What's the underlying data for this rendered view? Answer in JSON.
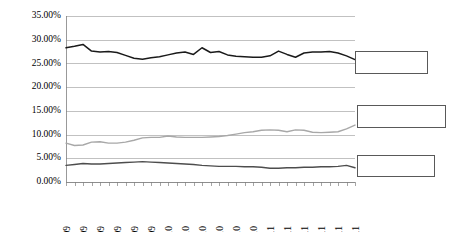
{
  "chart_data": {
    "type": "line",
    "title": "",
    "xlabel": "",
    "ylabel": "",
    "ylim": [
      0,
      35
    ],
    "ytick_values": [
      0,
      5,
      10,
      15,
      20,
      25,
      30,
      35
    ],
    "ytick_labels": [
      "0.00%",
      "5.00%",
      "10.00%",
      "15.00%",
      "20.00%",
      "25.00%",
      "30.00%",
      "35.00%"
    ],
    "grid": "horizontal",
    "legend": "none",
    "x": [
      "Jan-09",
      "Feb-09",
      "Mar-09",
      "Apr-09",
      "May-09",
      "Jun-09",
      "Jul-09",
      "Aug-09",
      "Sep-09",
      "Oct-09",
      "Nov-09",
      "Dec-09",
      "Jan-10",
      "Feb-10",
      "Mar-10",
      "Apr-10",
      "May-10",
      "Jun-10",
      "Jul-10",
      "Aug-10",
      "Sep-10",
      "Oct-10",
      "Nov-10",
      "Dec-10",
      "Jan-11",
      "Feb-11",
      "Mar-11",
      "Apr-11",
      "May-11",
      "Jun-11",
      "Jul-11",
      "Aug-11",
      "Sep-11",
      "Oct-11",
      "Nov-11"
    ],
    "xtick_labels": [
      "Jan-09",
      "Mar-09",
      "May-09",
      "Jul-09",
      "Sep-09",
      "Nov-09",
      "Jan-10",
      "Mar-10",
      "May-10",
      "Jul-10",
      "Sep-10",
      "Nov-10",
      "Jan-11",
      "Mar-11",
      "May-11",
      "Jul-11",
      "Sep-11",
      "Nov-11"
    ],
    "xtick_rotation": 90,
    "series": [
      {
        "name": "series-1",
        "color": "#1a1a1a",
        "width": 1.5,
        "values": [
          28.3,
          28.6,
          29.0,
          27.6,
          27.4,
          27.5,
          27.3,
          26.7,
          26.1,
          25.9,
          26.2,
          26.4,
          26.8,
          27.2,
          27.4,
          26.9,
          28.3,
          27.3,
          27.5,
          26.8,
          26.5,
          26.4,
          26.3,
          26.3,
          26.6,
          27.6,
          26.9,
          26.3,
          27.2,
          27.4,
          27.4,
          27.5,
          27.2,
          26.6,
          25.8
        ]
      },
      {
        "name": "series-2",
        "color": "#a8a8a8",
        "width": 1.4,
        "values": [
          8.2,
          7.7,
          7.8,
          8.4,
          8.5,
          8.2,
          8.2,
          8.4,
          8.8,
          9.3,
          9.4,
          9.4,
          9.7,
          9.5,
          9.4,
          9.4,
          9.4,
          9.5,
          9.6,
          9.8,
          10.1,
          10.4,
          10.6,
          10.9,
          11.0,
          10.9,
          10.6,
          11.0,
          10.9,
          10.5,
          10.4,
          10.5,
          10.6,
          11.2,
          12.0
        ]
      },
      {
        "name": "series-3",
        "color": "#4d4d4d",
        "width": 1.4,
        "values": [
          3.5,
          3.7,
          3.9,
          3.8,
          3.8,
          3.9,
          4.0,
          4.1,
          4.2,
          4.3,
          4.2,
          4.1,
          4.0,
          3.9,
          3.8,
          3.7,
          3.5,
          3.4,
          3.3,
          3.3,
          3.3,
          3.2,
          3.2,
          3.1,
          2.9,
          2.9,
          3.0,
          3.0,
          3.1,
          3.1,
          3.2,
          3.2,
          3.3,
          3.5,
          3.0
        ]
      }
    ],
    "callout_boxes": [
      {
        "name": "callout-box-top",
        "label": "",
        "x": 355,
        "y": 51,
        "width": 72,
        "height": 22
      },
      {
        "name": "callout-box-middle",
        "label": "",
        "x": 357,
        "y": 105,
        "width": 88,
        "height": 22
      },
      {
        "name": "callout-box-bottom",
        "label": "",
        "x": 357,
        "y": 155,
        "width": 77,
        "height": 21
      }
    ],
    "plot_area": {
      "left": 66,
      "top": 16,
      "right": 355,
      "bottom": 182
    }
  }
}
